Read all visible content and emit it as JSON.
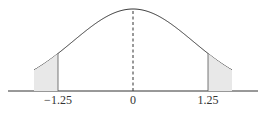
{
  "chart_data": {
    "type": "line",
    "title": "",
    "xlabel": "",
    "ylabel": "",
    "curve": "normal density, mean 0, sd 1",
    "x_range": [
      -1.65,
      1.65
    ],
    "tick_labels": [
      "-1.25",
      "0",
      "1.25"
    ],
    "tick_values": [
      -1.25,
      0,
      1.25
    ],
    "markers": [
      {
        "x": -1.25,
        "style": "solid vertical line to curve"
      },
      {
        "x": 0,
        "style": "dashed vertical line to peak"
      },
      {
        "x": 1.25,
        "style": "solid vertical line to curve"
      }
    ],
    "shaded_tails": [
      "x < -1.25",
      "x > 1.25"
    ],
    "grid": false,
    "legend": null
  },
  "labels": {
    "left": "−1.25",
    "center": "0",
    "right": "1.25"
  }
}
